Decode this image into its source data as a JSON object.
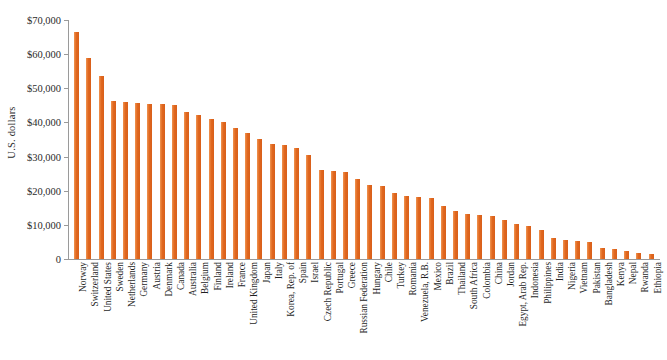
{
  "chart_data": {
    "type": "bar",
    "title": "",
    "xlabel": "",
    "ylabel": "U.S. dollars",
    "ylim": [
      0,
      70000
    ],
    "ytick_labels": [
      "$70,000",
      "$60,000",
      "$50,000",
      "$40,000",
      "$30,000",
      "$20,000",
      "$10,000",
      "0"
    ],
    "ytick_values": [
      70000,
      60000,
      50000,
      40000,
      30000,
      20000,
      10000,
      0
    ],
    "grid": false,
    "legend": null,
    "bar_color": "#E8762C",
    "axis_color": "#9A9A9A",
    "categories": [
      "Norway",
      "Switzerland",
      "United States",
      "Sweden",
      "Netherlands",
      "Germany",
      "Austria",
      "Denmark",
      "Canada",
      "Australia",
      "Belgium",
      "Finland",
      "Ireland",
      "France",
      "United Kingdom",
      "Japan",
      "Italy",
      "Korea, Rep. of",
      "Spain",
      "Israel",
      "Czech Republic",
      "Portugal",
      "Greece",
      "Russian Federation",
      "Hungary",
      "Chile",
      "Turkey",
      "Romania",
      "Venezuela, R.B.",
      "Mexico",
      "Brazil",
      "Thailand",
      "South Africa",
      "Colombia",
      "China",
      "Jordan",
      "Egypt, Arab Rep.",
      "Indonesia",
      "Philippines",
      "India",
      "Nigeria",
      "Vietnam",
      "Pakistan",
      "Bangladesh",
      "Kenya",
      "Nepal",
      "Rwanda",
      "Ethiopia"
    ],
    "values": [
      66500,
      58800,
      53500,
      46400,
      46000,
      45800,
      45500,
      45300,
      45100,
      43200,
      42100,
      41000,
      40000,
      38500,
      36800,
      35100,
      33700,
      33400,
      32600,
      30500,
      26100,
      25900,
      25400,
      23300,
      21800,
      21300,
      19300,
      18500,
      18300,
      17800,
      15500,
      14200,
      13100,
      12900,
      12700,
      11300,
      10300,
      9800,
      8400,
      6200,
      5700,
      5300,
      4900,
      3200,
      2900,
      2400,
      1700,
      1400
    ]
  },
  "axis": {
    "y_title": "U.S. dollars"
  }
}
